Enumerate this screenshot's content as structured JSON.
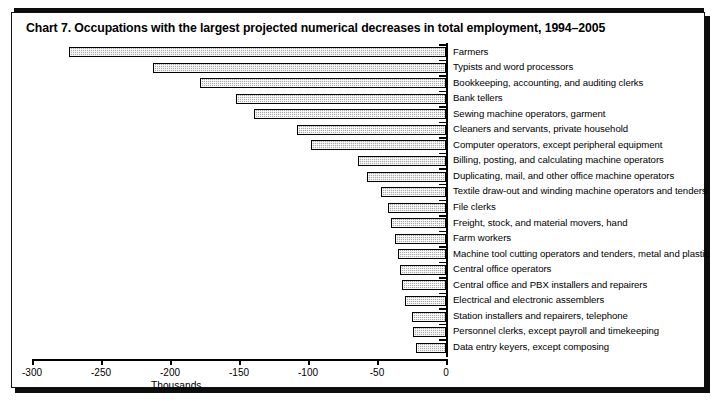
{
  "chart_data": {
    "type": "bar",
    "orientation": "horizontal",
    "title": "Chart 7.  Occupations with the largest projected numerical decreases in total employment, 1994–2005",
    "xlabel": "Thousands",
    "ylabel": "",
    "xlim": [
      -300,
      0
    ],
    "xticks": [
      -300,
      -250,
      -200,
      -150,
      -100,
      -50,
      0
    ],
    "xtick_labels": [
      "-300",
      "-250",
      "-200",
      "-150",
      "-100",
      "-50",
      "0"
    ],
    "grid": false,
    "legend": null,
    "bar_fill_color": "#a9a9a9",
    "bar_border_color": "#000000",
    "categories": [
      "Farmers",
      "Typists and word processors",
      "Bookkeeping, accounting, and auditing clerks",
      "Bank tellers",
      "Sewing machine operators, garment",
      "Cleaners and servants, private household",
      "Computer operators, except peripheral equipment",
      "Billing, posting, and calculating machine operators",
      "Duplicating, mail, and other office machine operators",
      "Textile draw-out and winding machine operators and tenders",
      "File clerks",
      "Freight, stock, and material movers, hand",
      "Farm workers",
      "Machine tool cutting operators  and tenders, metal and plastic",
      "Central office operators",
      "Central office and PBX installers and repairers",
      "Electrical and electronic assemblers",
      "Station installers and repairers, telephone",
      "Personnel clerks, except payroll and timekeeping",
      "Data entry keyers, except composing"
    ],
    "values": [
      -273,
      -212,
      -178,
      -152,
      -139,
      -108,
      -98,
      -64,
      -57,
      -47,
      -42,
      -40,
      -37,
      -35,
      -33,
      -32,
      -30,
      -25,
      -24,
      -22
    ]
  }
}
